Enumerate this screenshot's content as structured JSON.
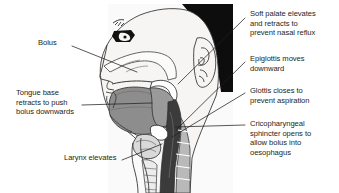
{
  "figure": {
    "background_color": "#ffffff",
    "ink_color": "#231f20"
  },
  "anatomy": {
    "view": "lateral-sagittal-head-and-neck",
    "facing": "left",
    "regions": [
      {
        "name": "hair",
        "color": "#0d0d0d"
      },
      {
        "name": "head-outline",
        "color": "#f4f3f1"
      },
      {
        "name": "ear",
        "color": "#f4f3f1"
      },
      {
        "name": "eye",
        "color": "#111111"
      },
      {
        "name": "tongue",
        "color": "#8d8d8d"
      },
      {
        "name": "bolus",
        "color": "#9a9a9a"
      },
      {
        "name": "soft-palate",
        "color": "#ffffff"
      },
      {
        "name": "epiglottis",
        "color": "#ffffff"
      },
      {
        "name": "pharynx-lumen",
        "color": "#3b3b3b"
      },
      {
        "name": "oesophagus",
        "color": "#2f2f2f"
      },
      {
        "name": "cervical-spine",
        "color": "#b9b9b9"
      },
      {
        "name": "larynx",
        "color": "#d9d9d9"
      },
      {
        "name": "hyoid",
        "color": "#ffffff"
      },
      {
        "name": "nasal-cavity",
        "color": "#fbfbfa"
      },
      {
        "name": "neck-soft-tissue",
        "color": "#efeeec"
      }
    ]
  },
  "labels": {
    "left": [
      {
        "id": "bolus",
        "text": "Bolus",
        "x": 38,
        "y": 42,
        "leader": {
          "from": [
            72,
            46
          ],
          "to": [
            137,
            72
          ]
        }
      },
      {
        "id": "tongue-base",
        "text": "Tongue base\nretracts to push\nbolus downwards",
        "x": 16,
        "y": 92,
        "leader": {
          "from": [
            82,
            105
          ],
          "to": [
            152,
            103
          ]
        }
      },
      {
        "id": "larynx-elevates",
        "text": "Larynx elevates",
        "x": 64,
        "y": 157,
        "leader": {
          "from": [
            122,
            160
          ],
          "to": [
            162,
            144
          ]
        }
      }
    ],
    "right": [
      {
        "id": "soft-palate",
        "text": "Soft palate elevates\nand retracts to\nprevent nasal reflux",
        "x": 250,
        "y": 11,
        "leader": {
          "from": [
            245,
            18
          ],
          "to": [
            178,
            84
          ]
        }
      },
      {
        "id": "epiglottis",
        "text": "Epiglottis moves\ndownward",
        "x": 250,
        "y": 56,
        "leader": {
          "from": [
            245,
            62
          ],
          "to": [
            176,
            130
          ]
        }
      },
      {
        "id": "glottis",
        "text": "Glottis closes to\nprevent aspiration",
        "x": 250,
        "y": 88,
        "leader": {
          "from": [
            245,
            93
          ],
          "to": [
            172,
            137
          ]
        }
      },
      {
        "id": "cricopharyngeal",
        "text": "Cricopharyngeal\nsphincter opens to\nallow bolus into\noesophagus",
        "x": 250,
        "y": 121,
        "leader": {
          "from": [
            245,
            125
          ],
          "to": [
            175,
            127
          ]
        }
      }
    ]
  }
}
